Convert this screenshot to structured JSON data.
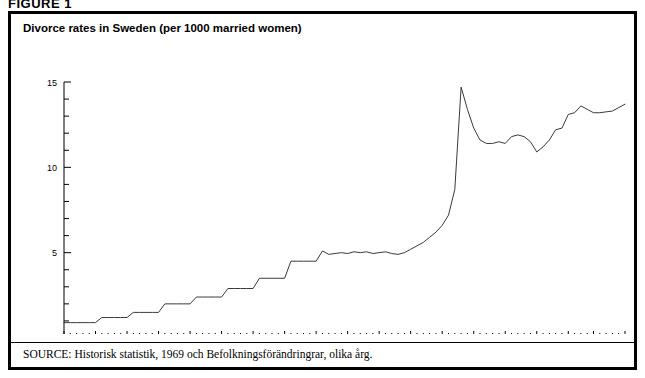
{
  "figure": {
    "label": "FIGURE 1",
    "source_prefix": "SOURCE:",
    "source_text": " Historisk statistik, 1969 och Befolkningsförändringrar, olika årg."
  },
  "chart_data": {
    "type": "line",
    "title": "Divorce rates in Sweden (per 1000 married women)",
    "xlabel": "",
    "ylabel": "",
    "xlim": [
      1911,
      2000
    ],
    "ylim": [
      0,
      15
    ],
    "y_ticks": [
      0,
      5,
      10,
      15
    ],
    "y_tick_labels": [
      "0",
      "5",
      "10",
      "15"
    ],
    "y_minor_step": 1,
    "x_tick_labels": [
      "1911",
      "1916",
      "1921",
      "1926",
      "1931",
      "1936",
      "1941",
      "1946",
      "1951",
      "1956",
      "1961",
      "1966",
      "1971",
      "1976",
      "1981",
      "1986",
      "1991",
      "1995",
      "2000"
    ],
    "x_tick_values": [
      1911,
      1916,
      1921,
      1926,
      1931,
      1936,
      1941,
      1946,
      1951,
      1956,
      1961,
      1966,
      1971,
      1976,
      1981,
      1986,
      1991,
      1995,
      2000
    ],
    "x_minor_step": 1,
    "grid": false,
    "legend": false,
    "line_color": "#3a3a3a",
    "series": [
      {
        "name": "Divorce rate per 1000 married women",
        "x": [
          1911,
          1912,
          1913,
          1914,
          1915,
          1916,
          1917,
          1918,
          1919,
          1920,
          1921,
          1922,
          1923,
          1924,
          1925,
          1926,
          1927,
          1928,
          1929,
          1930,
          1931,
          1932,
          1933,
          1934,
          1935,
          1936,
          1937,
          1938,
          1939,
          1940,
          1941,
          1942,
          1943,
          1944,
          1945,
          1946,
          1947,
          1948,
          1949,
          1950,
          1951,
          1952,
          1953,
          1954,
          1955,
          1956,
          1957,
          1958,
          1959,
          1960,
          1961,
          1962,
          1963,
          1964,
          1965,
          1966,
          1967,
          1968,
          1969,
          1970,
          1971,
          1972,
          1973,
          1974,
          1975,
          1976,
          1977,
          1978,
          1979,
          1980,
          1981,
          1982,
          1983,
          1984,
          1985,
          1986,
          1987,
          1988,
          1989,
          1990,
          1991,
          1992,
          1993,
          1994,
          1995,
          1996,
          1997,
          1998,
          1999,
          2000
        ],
        "y": [
          0.9,
          0.9,
          0.9,
          0.9,
          0.9,
          0.9,
          1.2,
          1.2,
          1.2,
          1.2,
          1.2,
          1.5,
          1.5,
          1.5,
          1.5,
          1.5,
          2.0,
          2.0,
          2.0,
          2.0,
          2.0,
          2.4,
          2.4,
          2.4,
          2.4,
          2.4,
          2.9,
          2.9,
          2.9,
          2.9,
          2.9,
          3.5,
          3.5,
          3.5,
          3.5,
          3.5,
          4.5,
          4.5,
          4.5,
          4.5,
          4.5,
          5.1,
          4.9,
          4.95,
          5.0,
          4.95,
          5.05,
          5.0,
          5.05,
          4.95,
          5.0,
          5.05,
          4.95,
          4.9,
          5.0,
          5.2,
          5.4,
          5.6,
          5.9,
          6.2,
          6.6,
          7.2,
          8.7,
          14.7,
          13.4,
          12.3,
          11.6,
          11.4,
          11.4,
          11.5,
          11.4,
          11.8,
          11.9,
          11.8,
          11.5,
          10.9,
          11.2,
          11.6,
          12.2,
          12.3,
          13.1,
          13.2,
          13.6,
          13.4,
          13.2,
          13.2,
          13.25,
          13.3,
          13.5,
          13.7
        ]
      }
    ]
  }
}
